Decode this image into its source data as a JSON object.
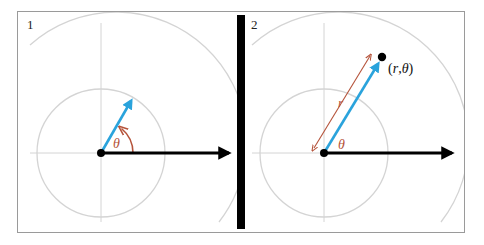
{
  "figure": {
    "panels": [
      {
        "number": "1",
        "angle_label": "θ",
        "description": "Unit vector at angle θ from the positive x-axis"
      },
      {
        "number": "2",
        "angle_label": "θ",
        "radius_label": "r",
        "point_label": "(r,θ)",
        "point_label_parts": [
          "(",
          "r",
          ",",
          "θ",
          ")"
        ],
        "description": "Point at distance r along direction θ"
      }
    ],
    "colors": {
      "frame": "#9a9a9a",
      "grid": "#d4d4d4",
      "axis_arrow": "#000000",
      "direction_vector": "#2aa3dc",
      "angle_and_radius": "#b5533a",
      "divider": "#000000"
    }
  }
}
